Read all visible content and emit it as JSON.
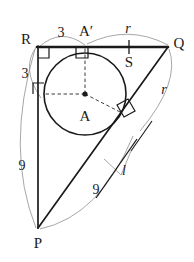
{
  "figure": {
    "colors": {
      "stroke": "#1a1a1a",
      "thin": "#8a8a8a",
      "dash": "#4a4a4a",
      "background": "#ffffff"
    },
    "points": {
      "P": {
        "label": "P",
        "x": 38,
        "y": 228,
        "label_x": 38,
        "label_y": 243
      },
      "R": {
        "label": "R",
        "x": 38,
        "y": 47,
        "label_x": 26,
        "label_y": 39
      },
      "Q": {
        "label": "Q",
        "x": 168,
        "y": 47,
        "label_x": 179,
        "label_y": 43
      },
      "A": {
        "label": "A",
        "x": 85,
        "y": 94,
        "label_x": 85,
        "label_y": 116
      },
      "Aprime": {
        "label": "A′",
        "x": 85,
        "y": 47,
        "label_x": 86,
        "label_y": 31
      },
      "S": {
        "label": "S",
        "x": 129,
        "y": 47,
        "label_x": 129,
        "label_y": 62
      }
    },
    "circle": {
      "cx": 85,
      "cy": 94,
      "r": 41
    },
    "labels": [
      {
        "name": "segment-length-RAprime",
        "text": "3",
        "x": 61,
        "y": 33,
        "style": "len"
      },
      {
        "name": "segment-length-RT",
        "text": "3",
        "x": 25,
        "y": 74,
        "style": "len"
      },
      {
        "name": "segment-length-AprimeQ-radius",
        "text": "r",
        "x": 128,
        "y": 29,
        "style": "it"
      },
      {
        "name": "segment-length-QT-radius",
        "text": "r",
        "x": 164,
        "y": 90,
        "style": "it"
      },
      {
        "name": "segment-length-RP",
        "text": "9",
        "x": 22,
        "y": 166,
        "style": "len"
      },
      {
        "name": "segment-length-PT",
        "text": "9",
        "x": 96,
        "y": 190,
        "style": "len"
      },
      {
        "name": "tangent-line-label",
        "text": "l",
        "x": 124,
        "y": 171,
        "style": "it"
      }
    ]
  }
}
